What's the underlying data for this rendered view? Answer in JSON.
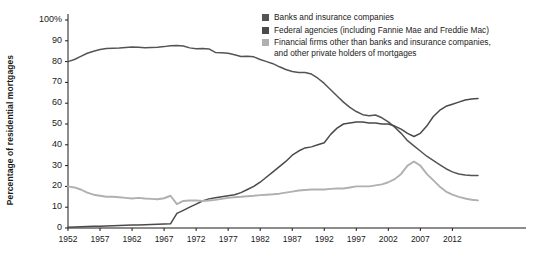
{
  "chart_data": {
    "type": "line",
    "title": "",
    "xlabel": "",
    "ylabel": "Percentage of residential mortgages",
    "xlim": [
      1952,
      2016
    ],
    "ylim": [
      0,
      100
    ],
    "grid": false,
    "legend_position": "top-right",
    "xticks": [
      "1952",
      "1957",
      "1962",
      "1967",
      "1972",
      "1977",
      "1982",
      "1987",
      "1992",
      "1997",
      "2002",
      "2007",
      "2012"
    ],
    "xtick_values": [
      1952,
      1957,
      1962,
      1967,
      1972,
      1977,
      1982,
      1987,
      1992,
      1997,
      2002,
      2007,
      2012
    ],
    "yticks": [
      "0",
      "10",
      "20",
      "30",
      "40",
      "50",
      "60",
      "70",
      "80",
      "90",
      "100%"
    ],
    "ytick_values": [
      0,
      10,
      20,
      30,
      40,
      50,
      60,
      70,
      80,
      90,
      100
    ],
    "series": [
      {
        "name": "Banks and insurance companies",
        "color": "#545454",
        "x": [
          1952,
          1953,
          1954,
          1955,
          1956,
          1957,
          1958,
          1959,
          1960,
          1961,
          1962,
          1963,
          1964,
          1965,
          1966,
          1967,
          1968,
          1969,
          1970,
          1971,
          1972,
          1973,
          1974,
          1975,
          1976,
          1977,
          1978,
          1979,
          1980,
          1981,
          1982,
          1983,
          1984,
          1985,
          1986,
          1987,
          1988,
          1989,
          1990,
          1991,
          1992,
          1993,
          1994,
          1995,
          1996,
          1997,
          1998,
          1999,
          2000,
          2001,
          2002,
          2003,
          2004,
          2005,
          2006,
          2007,
          2008,
          2009,
          2010,
          2011,
          2012,
          2013,
          2014,
          2015,
          2016
        ],
        "values": [
          80,
          81,
          82.5,
          84,
          85,
          85.8,
          86.3,
          86.4,
          86.5,
          86.8,
          87,
          86.9,
          86.6,
          86.8,
          86.9,
          87.2,
          87.6,
          87.8,
          87.5,
          86.6,
          86.2,
          86.3,
          86.1,
          84.4,
          84.2,
          84,
          83.3,
          82.5,
          82.6,
          82.3,
          81,
          80,
          79,
          77.5,
          76.2,
          75.2,
          74.8,
          74.8,
          74,
          72,
          69.5,
          66.5,
          63.5,
          60.5,
          58,
          56,
          54.5,
          54,
          54.3,
          53,
          51,
          48.5,
          45.5,
          42,
          39.5,
          37,
          34.5,
          32.5,
          30.5,
          28.5,
          27,
          26,
          25.5,
          25.3,
          25.2
        ]
      },
      {
        "name": "Federal agencies (including Fannie Mae and Freddie Mac)",
        "color": "#4a4a4a",
        "x": [
          1952,
          1953,
          1954,
          1955,
          1956,
          1957,
          1958,
          1959,
          1960,
          1961,
          1962,
          1963,
          1964,
          1965,
          1966,
          1967,
          1968,
          1969,
          1970,
          1971,
          1972,
          1973,
          1974,
          1975,
          1976,
          1977,
          1978,
          1979,
          1980,
          1981,
          1982,
          1983,
          1984,
          1985,
          1986,
          1987,
          1988,
          1989,
          1990,
          1991,
          1992,
          1993,
          1994,
          1995,
          1996,
          1997,
          1998,
          1999,
          2000,
          2001,
          2002,
          2003,
          2004,
          2005,
          2006,
          2007,
          2008,
          2009,
          2010,
          2011,
          2012,
          2013,
          2014,
          2015,
          2016
        ],
        "values": [
          0.4,
          0.5,
          0.6,
          0.7,
          0.8,
          0.9,
          1,
          1.1,
          1.2,
          1.3,
          1.4,
          1.5,
          1.6,
          1.7,
          1.8,
          1.9,
          2,
          7,
          8.5,
          10,
          11.5,
          13,
          14,
          14.5,
          15,
          15.5,
          16,
          17,
          18.5,
          20,
          22,
          24.5,
          27,
          29.5,
          32,
          35,
          37,
          38.5,
          39,
          40,
          41,
          45,
          48,
          50,
          50.5,
          51,
          51,
          50.5,
          50.5,
          50,
          50,
          49,
          47.5,
          45.5,
          44,
          45.5,
          49,
          53.5,
          56.5,
          58.5,
          59.5,
          60.5,
          61.5,
          62,
          62.3
        ]
      },
      {
        "name": "Financial firms other than banks and insurance companies,\nand other private holders of mortgages",
        "color": "#b0b0b0",
        "x": [
          1952,
          1953,
          1954,
          1955,
          1956,
          1957,
          1958,
          1959,
          1960,
          1961,
          1962,
          1963,
          1964,
          1965,
          1966,
          1967,
          1968,
          1969,
          1970,
          1971,
          1972,
          1973,
          1974,
          1975,
          1976,
          1977,
          1978,
          1979,
          1980,
          1981,
          1982,
          1983,
          1984,
          1985,
          1986,
          1987,
          1988,
          1989,
          1990,
          1991,
          1992,
          1993,
          1994,
          1995,
          1996,
          1997,
          1998,
          1999,
          2000,
          2001,
          2002,
          2003,
          2004,
          2005,
          2006,
          2007,
          2008,
          2009,
          2010,
          2011,
          2012,
          2013,
          2014,
          2015,
          2016
        ],
        "values": [
          20,
          19.5,
          18.5,
          17,
          16,
          15.5,
          15,
          15,
          14.8,
          14.5,
          14.2,
          14.5,
          14.2,
          14,
          13.8,
          14.3,
          15.5,
          11.5,
          13,
          13.2,
          13.3,
          13,
          13.2,
          13.5,
          14,
          14.5,
          14.8,
          15,
          15.3,
          15.5,
          15.8,
          16,
          16.2,
          16.5,
          17,
          17.5,
          18,
          18.3,
          18.5,
          18.5,
          18.5,
          18.8,
          19,
          19,
          19.5,
          20,
          20,
          20,
          20.5,
          21,
          22,
          23.5,
          26,
          30,
          32,
          30,
          26,
          23,
          20,
          17.5,
          16,
          15,
          14.2,
          13.6,
          13.3
        ]
      }
    ]
  },
  "legend": {
    "items": [
      {
        "label": "Banks and insurance companies",
        "color": "#545454"
      },
      {
        "label": "Federal agencies (including Fannie Mae and Freddie Mac)",
        "color": "#4a4a4a"
      },
      {
        "label": "Financial firms other than banks and insurance companies,\nand other private holders of mortgages",
        "color": "#b0b0b0"
      }
    ]
  },
  "axis": {
    "y_title": "Percentage of residential mortgages"
  }
}
